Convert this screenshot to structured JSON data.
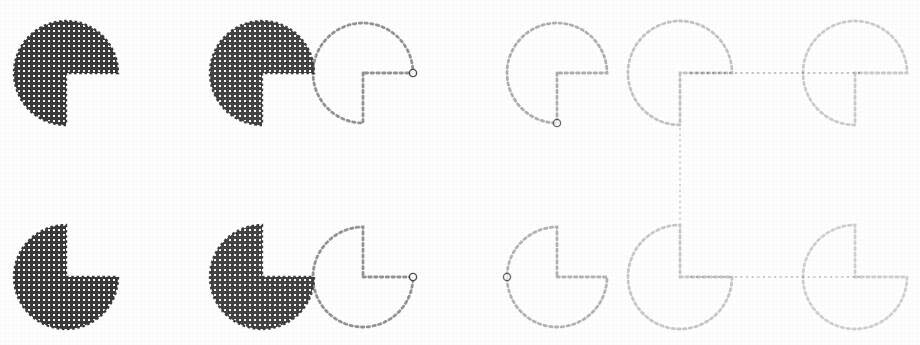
{
  "figure": {
    "background_color": "#fefefe",
    "width": 920,
    "height": 345,
    "ink_color": "#3a3a3a"
  },
  "chart_data": {
    "type": "scatter",
    "xlabel": "",
    "ylabel": "",
    "grid": false,
    "legend": "none",
    "xlim": [
      0,
      920
    ],
    "ylim": [
      0,
      345
    ],
    "categories": [
      "disc-1",
      "disc-2",
      "disc-3",
      "disc-4",
      "disc-5",
      "disc-6",
      "disc-7",
      "disc-8",
      "disc-9",
      "disc-10",
      "disc-11",
      "disc-12"
    ],
    "series": [
      {
        "name": "center_x",
        "values": [
          66,
          262,
          363,
          557,
          680,
          855,
          66,
          262,
          363,
          557,
          680,
          855
        ]
      },
      {
        "name": "center_y",
        "values": [
          73,
          73,
          73,
          73,
          73,
          73,
          277,
          277,
          277,
          277,
          277,
          277
        ]
      },
      {
        "name": "radius",
        "values": [
          52,
          52,
          50,
          50,
          52,
          52,
          52,
          52,
          50,
          50,
          52,
          52
        ]
      },
      {
        "name": "wedge_start_deg",
        "values": [
          0,
          0,
          0,
          0,
          0,
          0,
          270,
          270,
          270,
          270,
          270,
          270
        ]
      },
      {
        "name": "wedge_extent_deg",
        "values": [
          90,
          90,
          90,
          90,
          90,
          90,
          90,
          90,
          90,
          90,
          90,
          90
        ]
      },
      {
        "name": "ink_opacity",
        "values": [
          1.0,
          0.95,
          0.42,
          0.33,
          0.24,
          0.2,
          1.0,
          0.95,
          0.42,
          0.3,
          0.22,
          0.18
        ]
      }
    ]
  },
  "items": [
    {
      "id": "disc-1",
      "name": "disc-solid-notch-right",
      "cx": 66,
      "cy": 73,
      "r": 52,
      "style": "hatched",
      "opacity": 1.0,
      "wedge_start": 0,
      "wedge_extent": 90,
      "marker": false
    },
    {
      "id": "disc-2",
      "name": "disc-solid-notch-right-second",
      "cx": 262,
      "cy": 73,
      "r": 52,
      "style": "hatched",
      "opacity": 0.95,
      "wedge_start": 0,
      "wedge_extent": 90,
      "marker": false
    },
    {
      "id": "disc-3",
      "name": "disc-dotted-notch-right",
      "cx": 363,
      "cy": 73,
      "r": 50,
      "style": "dotted",
      "opacity": 0.55,
      "wedge_start": 0,
      "wedge_extent": 90,
      "marker": true,
      "marker_side": "right"
    },
    {
      "id": "disc-4",
      "name": "disc-faint-notch-right",
      "cx": 557,
      "cy": 73,
      "r": 50,
      "style": "dotted",
      "opacity": 0.4,
      "wedge_start": 0,
      "wedge_extent": 90,
      "marker": true,
      "marker_side": "bottom"
    },
    {
      "id": "disc-5",
      "name": "disc-faint-notch-right-linked",
      "cx": 680,
      "cy": 73,
      "r": 52,
      "style": "dotted",
      "opacity": 0.3,
      "wedge_start": 0,
      "wedge_extent": 90,
      "marker": false
    },
    {
      "id": "disc-6",
      "name": "disc-faint-notch-right-end",
      "cx": 855,
      "cy": 73,
      "r": 52,
      "style": "dotted",
      "opacity": 0.26,
      "wedge_start": 0,
      "wedge_extent": 90,
      "marker": false
    },
    {
      "id": "disc-7",
      "name": "disc-solid-notch-up",
      "cx": 66,
      "cy": 277,
      "r": 52,
      "style": "hatched",
      "opacity": 1.0,
      "wedge_start": 270,
      "wedge_extent": 90,
      "marker": false
    },
    {
      "id": "disc-8",
      "name": "disc-solid-notch-up-second",
      "cx": 262,
      "cy": 277,
      "r": 52,
      "style": "hatched",
      "opacity": 0.95,
      "wedge_start": 270,
      "wedge_extent": 90,
      "marker": false
    },
    {
      "id": "disc-9",
      "name": "disc-dotted-notch-up",
      "cx": 363,
      "cy": 277,
      "r": 50,
      "style": "dotted",
      "opacity": 0.55,
      "wedge_start": 270,
      "wedge_extent": 90,
      "marker": true,
      "marker_side": "right"
    },
    {
      "id": "disc-10",
      "name": "disc-faint-notch-up",
      "cx": 557,
      "cy": 277,
      "r": 50,
      "style": "dotted",
      "opacity": 0.38,
      "wedge_start": 270,
      "wedge_extent": 90,
      "marker": true,
      "marker_side": "left"
    },
    {
      "id": "disc-11",
      "name": "disc-faint-notch-up-linked",
      "cx": 680,
      "cy": 277,
      "r": 52,
      "style": "dotted",
      "opacity": 0.28,
      "wedge_start": 270,
      "wedge_extent": 90,
      "marker": false
    },
    {
      "id": "disc-12",
      "name": "disc-faint-notch-up-end",
      "cx": 855,
      "cy": 277,
      "r": 52,
      "style": "dotted",
      "opacity": 0.24,
      "wedge_start": 270,
      "wedge_extent": 90,
      "marker": false
    }
  ],
  "connectors": [
    {
      "id": "conn-top-horizontal",
      "name": "connector-disc5-to-disc6",
      "orientation": "horizontal",
      "x1": 690,
      "y1": 73,
      "x2": 860,
      "y2": 73,
      "opacity": 0.3
    },
    {
      "id": "conn-vertical",
      "name": "connector-disc5-to-disc11",
      "orientation": "vertical",
      "x1": 680,
      "y1": 128,
      "x2": 680,
      "y2": 222,
      "opacity": 0.24
    },
    {
      "id": "conn-bottom-horizontal",
      "name": "connector-disc11-to-disc12",
      "orientation": "horizontal",
      "x1": 690,
      "y1": 277,
      "x2": 860,
      "y2": 277,
      "opacity": 0.24
    }
  ]
}
